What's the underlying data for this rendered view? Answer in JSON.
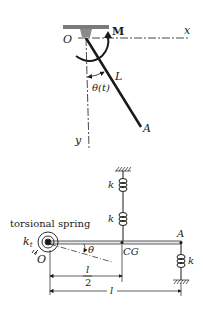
{
  "top_figure": {
    "origin_label": "O",
    "moment_label": "M",
    "x_axis_label": "x",
    "y_axis_label": "y",
    "length_label": "L",
    "angle_label": "θ(t)",
    "end_label": "A"
  },
  "bottom_figure": {
    "torsional_spring_label": "torsional spring",
    "torsional_constant_label": "k",
    "torsional_constant_sub": "t",
    "origin_label": "O",
    "angle_label": "θ",
    "cg_label": "CG",
    "end_label": "A",
    "spring_upper_label": "k",
    "spring_middle_label": "k",
    "spring_right_label": "k",
    "half_length_num": "l",
    "half_length_den": "2",
    "full_length_label": "l"
  },
  "colors": {
    "ink": "#1a1a1a",
    "support": "#7a7a7a",
    "bar_fill": "#e8e8e8"
  }
}
